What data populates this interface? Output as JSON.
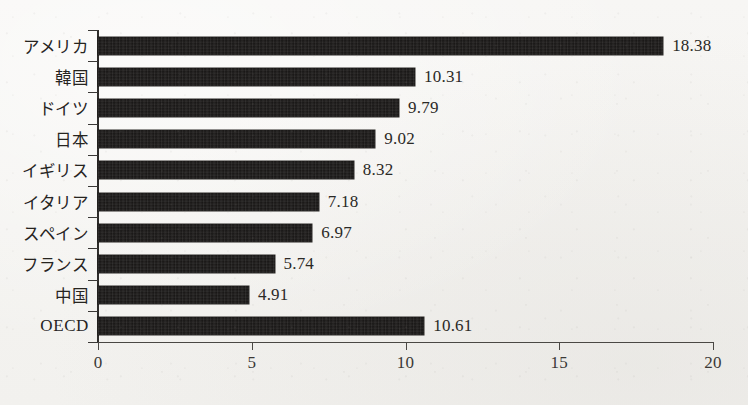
{
  "chart_data": {
    "type": "bar",
    "orientation": "horizontal",
    "title": "",
    "subtitle": "",
    "xlabel": "",
    "ylabel": "",
    "categories": [
      "アメリカ",
      "韓国",
      "ドイツ",
      "日本",
      "イギリス",
      "イタリア",
      "スペイン",
      "フランス",
      "中国",
      "OECD"
    ],
    "values": [
      18.38,
      10.31,
      9.79,
      9.02,
      8.32,
      7.18,
      6.97,
      5.74,
      4.91,
      10.61
    ],
    "value_labels": [
      "18.38",
      "10.31",
      "9.79",
      "9.02",
      "8.32",
      "7.18",
      "6.97",
      "5.74",
      "4.91",
      "10.61"
    ],
    "xlim": [
      0,
      20
    ],
    "xticks": [
      0,
      5,
      10,
      15,
      20
    ],
    "xtick_labels": [
      "0",
      "5",
      "10",
      "15",
      "20"
    ],
    "grid": false,
    "legend": null,
    "series": [
      {
        "name": "",
        "values": [
          18.38,
          10.31,
          9.79,
          9.02,
          8.32,
          7.18,
          6.97,
          5.74,
          4.91,
          10.61
        ]
      }
    ],
    "colors": {
      "bar": "#151312",
      "axis": "#3a3836",
      "text": "#26241f",
      "background": "#f6f5f3"
    }
  }
}
